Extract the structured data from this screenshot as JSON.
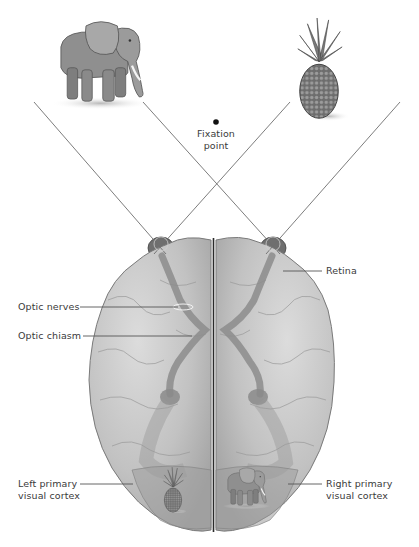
{
  "diagram": {
    "colors": {
      "background": "#ffffff",
      "brain_fill": "#bdbdbd",
      "brain_light": "#d6d6d6",
      "pathway": "#8a8a8a",
      "sight_line": "#6e6e6e",
      "label_text": "#3a3a3a",
      "leader_line": "#555555"
    },
    "objects": {
      "left_object": "elephant",
      "right_object": "pineapple",
      "left_cortex_image": "pineapple",
      "right_cortex_image": "elephant"
    },
    "labels": {
      "fixation_line1": "Fixation",
      "fixation_line2": "point",
      "retina": "Retina",
      "optic_nerves": "Optic nerves",
      "optic_chiasm": "Optic chiasm",
      "left_cortex_line1": "Left primary",
      "left_cortex_line2": "visual cortex",
      "right_cortex_line1": "Right primary",
      "right_cortex_line2": "visual cortex"
    }
  }
}
